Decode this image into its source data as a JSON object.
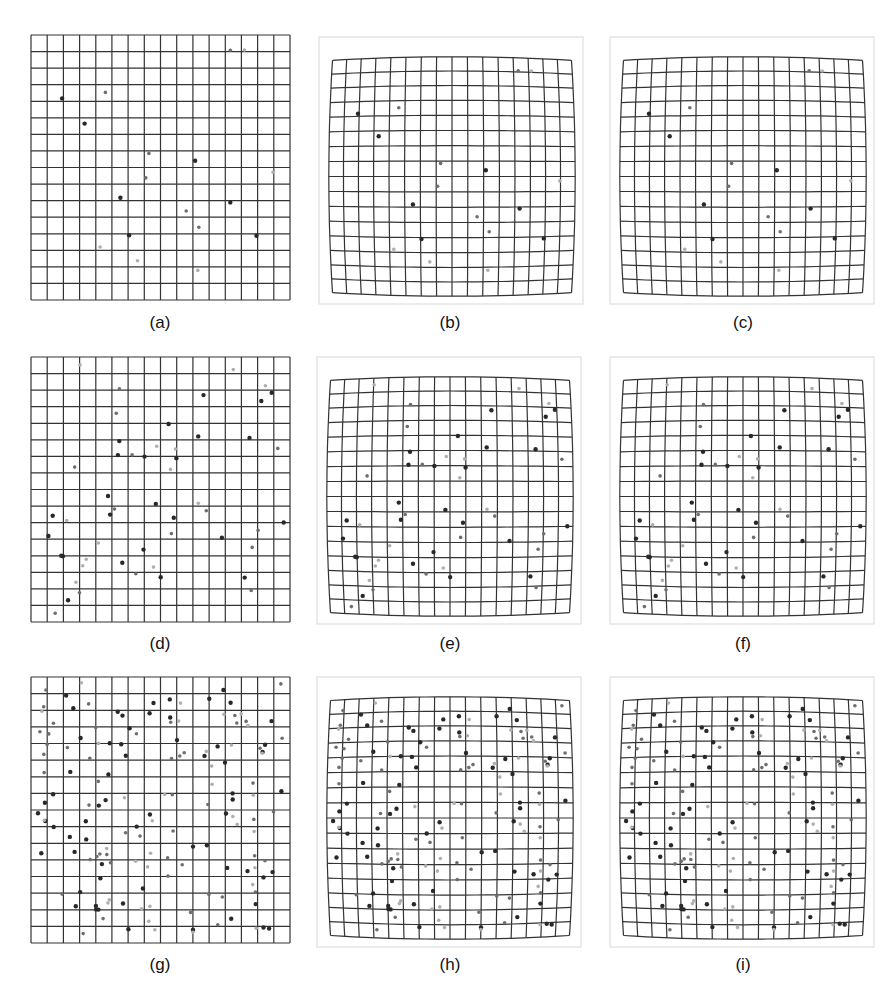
{
  "figure": {
    "grid_cells": 16,
    "line_color": "#333333",
    "frame_color": "#d8d8d8",
    "panels": [
      {
        "id": "a",
        "caption": "(a)",
        "x": 31,
        "y": 35,
        "w": 259,
        "h": 265,
        "distortion": 0,
        "frame": false,
        "density": 18,
        "seed": 11,
        "cap_x": 130,
        "cap_y": 313
      },
      {
        "id": "b",
        "caption": "(b)",
        "x": 327,
        "y": 55,
        "w": 250,
        "h": 243,
        "distortion": 0.06,
        "frame": true,
        "density": 18,
        "seed": 11,
        "cap_x": 420,
        "cap_y": 313
      },
      {
        "id": "c",
        "caption": "(c)",
        "x": 618,
        "y": 55,
        "w": 250,
        "h": 243,
        "distortion": 0.06,
        "frame": true,
        "density": 18,
        "seed": 11,
        "cap_x": 713,
        "cap_y": 313
      },
      {
        "id": "d",
        "caption": "(d)",
        "x": 31,
        "y": 357,
        "w": 259,
        "h": 265,
        "distortion": 0,
        "frame": false,
        "density": 52,
        "seed": 23,
        "cap_x": 130,
        "cap_y": 634
      },
      {
        "id": "e",
        "caption": "(e)",
        "x": 325,
        "y": 375,
        "w": 250,
        "h": 243,
        "distortion": 0.06,
        "frame": true,
        "density": 52,
        "seed": 23,
        "cap_x": 420,
        "cap_y": 634
      },
      {
        "id": "f",
        "caption": "(f)",
        "x": 618,
        "y": 375,
        "w": 250,
        "h": 243,
        "distortion": 0.06,
        "frame": true,
        "density": 52,
        "seed": 23,
        "cap_x": 713,
        "cap_y": 634
      },
      {
        "id": "g",
        "caption": "(g)",
        "x": 31,
        "y": 677,
        "w": 259,
        "h": 266,
        "distortion": 0,
        "frame": false,
        "density": 150,
        "seed": 37,
        "cap_x": 130,
        "cap_y": 955
      },
      {
        "id": "h",
        "caption": "(h)",
        "x": 325,
        "y": 695,
        "w": 250,
        "h": 246,
        "distortion": 0.06,
        "frame": true,
        "density": 150,
        "seed": 37,
        "cap_x": 420,
        "cap_y": 955
      },
      {
        "id": "i",
        "caption": "(i)",
        "x": 618,
        "y": 695,
        "w": 250,
        "h": 246,
        "distortion": 0.06,
        "frame": true,
        "density": 150,
        "seed": 37,
        "cap_x": 713,
        "cap_y": 955
      }
    ]
  }
}
